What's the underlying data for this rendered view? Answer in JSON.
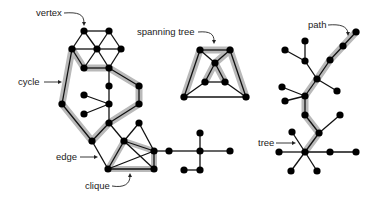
{
  "diagram": {
    "labels": {
      "vertex": "vertex",
      "cycle": "cycle",
      "edge": "edge",
      "clique": "clique",
      "spanning_tree": "spanning tree",
      "path": "path",
      "tree": "tree"
    },
    "colors": {
      "node": "#000000",
      "edge": "#111111",
      "highlight": "#b9b9b9",
      "text": "#222222"
    },
    "graphs": [
      {
        "name": "graph-with-cycle-and-clique",
        "concepts": [
          "vertex",
          "cycle",
          "edge",
          "clique"
        ]
      },
      {
        "name": "spanning-tree-graph",
        "concepts": [
          "spanning tree"
        ]
      },
      {
        "name": "tree-with-path",
        "concepts": [
          "path",
          "tree"
        ]
      }
    ]
  }
}
